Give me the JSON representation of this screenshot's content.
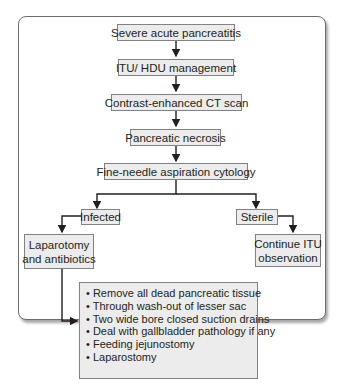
{
  "nodes": {
    "severe": "Severe acute pancreatitis",
    "itu": "ITU/ HDU management",
    "ct": "Contrast-enhanced CT scan",
    "necrosis": "Pancreatic necrosis",
    "fna": "Fine-needle aspiration cytology",
    "infected": "Infected",
    "sterile": "Sterile",
    "laparotomy_line1": "Laparotomy",
    "laparotomy_line2": "and antibiotics",
    "continue_line1": "Continue ITU",
    "continue_line2": "observation"
  },
  "steps": [
    "• Remove all dead pancreatic tissue",
    "• Through wash-out of lesser sac",
    "• Two wide bore closed suction drains",
    "• Deal with gallbladder pathology if any",
    "• Feeding jejunostomy",
    "• Laparostomy"
  ]
}
